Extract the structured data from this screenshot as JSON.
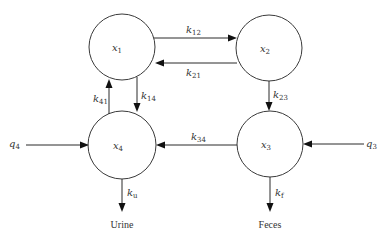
{
  "diagram": {
    "type": "compartment-model",
    "compartments": [
      {
        "id": "x1",
        "symbol": "x",
        "subscript": "1",
        "cx": 122,
        "cy": 47,
        "r": 33
      },
      {
        "id": "x2",
        "symbol": "x",
        "subscript": "2",
        "cx": 269,
        "cy": 48,
        "r": 33
      },
      {
        "id": "x3",
        "symbol": "x",
        "subscript": "3",
        "cx": 270,
        "cy": 144,
        "r": 33
      },
      {
        "id": "x4",
        "symbol": "x",
        "subscript": "4",
        "cx": 122,
        "cy": 145,
        "r": 34
      }
    ],
    "rate_constants": [
      {
        "id": "k12",
        "symbol": "k",
        "subscript": "12",
        "from": "x1",
        "to": "x2"
      },
      {
        "id": "k21",
        "symbol": "k",
        "subscript": "21",
        "from": "x2",
        "to": "x1"
      },
      {
        "id": "k23",
        "symbol": "k",
        "subscript": "23",
        "from": "x2",
        "to": "x3"
      },
      {
        "id": "k34",
        "symbol": "k",
        "subscript": "34",
        "from": "x3",
        "to": "x4"
      },
      {
        "id": "k14",
        "symbol": "k",
        "subscript": "14",
        "from": "x1",
        "to": "x4"
      },
      {
        "id": "k41",
        "symbol": "k",
        "subscript": "41",
        "from": "x4",
        "to": "x1"
      },
      {
        "id": "ku",
        "symbol": "k",
        "subscript": "u",
        "from": "x4",
        "to": "Urine"
      },
      {
        "id": "kf",
        "symbol": "k",
        "subscript": "f",
        "from": "x3",
        "to": "Feces"
      }
    ],
    "inputs": [
      {
        "id": "q4",
        "symbol": "q",
        "subscript": "4",
        "to": "x4"
      },
      {
        "id": "q3",
        "symbol": "q",
        "subscript": "3",
        "to": "x3"
      }
    ],
    "outputs": [
      {
        "id": "urine",
        "label": "Urine",
        "from": "x4"
      },
      {
        "id": "feces",
        "label": "Feces",
        "from": "x3"
      }
    ]
  }
}
